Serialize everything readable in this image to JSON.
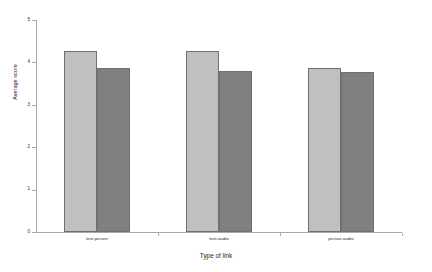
{
  "chart_data": {
    "type": "bar",
    "title": "",
    "xlabel": "Type of link",
    "ylabel": "Average score",
    "categories": [
      "text-picture",
      "text-audio",
      "picture-audio"
    ],
    "series": [
      {
        "name": "series-1",
        "color": "#c0c0c0",
        "values": [
          4.27,
          4.27,
          3.87
        ]
      },
      {
        "name": "series-2",
        "color": "#808080",
        "values": [
          3.87,
          3.8,
          3.78
        ]
      }
    ],
    "ylim": [
      0,
      5
    ],
    "yticks": [
      0,
      1,
      2,
      3,
      4,
      5
    ],
    "ytick_labels": [
      "0",
      "1",
      "2",
      "3",
      "4",
      "5"
    ],
    "grid": false,
    "legend": "none",
    "axis_color": "#a9a9a9",
    "background": "#ffffff"
  }
}
